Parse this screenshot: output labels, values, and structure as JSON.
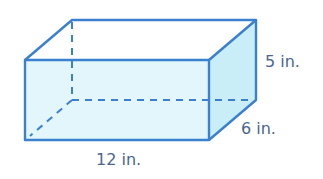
{
  "figure": {
    "type": "rectangular-prism",
    "labels": {
      "height": "5 in.",
      "depth": "6 in.",
      "length": "12 in."
    },
    "colors": {
      "edge": "#3a7fd0",
      "front_fill": "#e3f6fb",
      "side_fill": "#c9eef8",
      "label": "#4a6690"
    }
  }
}
